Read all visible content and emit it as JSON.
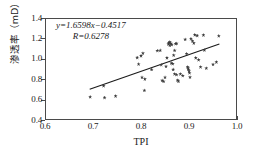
{
  "chart_data": {
    "type": "scatter",
    "title": "",
    "xlabel": "TPI",
    "ylabel": "渗透率（mD）",
    "xlim": [
      0.6,
      1.0
    ],
    "ylim": [
      0.4,
      1.4
    ],
    "xticks": [
      "0.6",
      "0.7",
      "0.8",
      "0.9",
      "1.0"
    ],
    "xtick_values": [
      0.6,
      0.7,
      0.8,
      0.9,
      1.0
    ],
    "yticks": [
      "0.4",
      "0.6",
      "0.8",
      "1.0",
      "1.2",
      "1.4"
    ],
    "ytick_values": [
      0.4,
      0.6,
      0.8,
      1.0,
      1.2,
      1.4
    ],
    "grid": false,
    "legend": null,
    "marker_color": "#3d3d3d",
    "line_color": "#1a1a1a",
    "annotations": {
      "equation": "y=1.6598x−0.4517",
      "equation_slope": 1.6598,
      "equation_intercept": -0.4517,
      "correlation_label": "R=0.6278",
      "correlation_value": 0.6278
    },
    "trendline": {
      "x": [
        0.692,
        0.965
      ],
      "y": [
        0.697,
        1.151
      ]
    },
    "points": [
      [
        0.692,
        0.637
      ],
      [
        0.72,
        0.745
      ],
      [
        0.722,
        0.63
      ],
      [
        0.745,
        0.645
      ],
      [
        0.79,
        1.022
      ],
      [
        0.793,
        0.958
      ],
      [
        0.798,
        1.04
      ],
      [
        0.802,
        1.065
      ],
      [
        0.8,
        0.828
      ],
      [
        0.806,
        0.812
      ],
      [
        0.805,
        0.7
      ],
      [
        0.82,
        0.905
      ],
      [
        0.832,
        1.09
      ],
      [
        0.838,
        1.093
      ],
      [
        0.84,
        0.952
      ],
      [
        0.842,
        0.798
      ],
      [
        0.845,
        0.788
      ],
      [
        0.848,
        0.828
      ],
      [
        0.85,
        0.935
      ],
      [
        0.852,
        1.02
      ],
      [
        0.855,
        1.155
      ],
      [
        0.856,
        1.168
      ],
      [
        0.858,
        1.175
      ],
      [
        0.86,
        1.16
      ],
      [
        0.862,
        1.15
      ],
      [
        0.858,
        1.142
      ],
      [
        0.861,
        0.968
      ],
      [
        0.864,
        0.962
      ],
      [
        0.866,
        1.045
      ],
      [
        0.868,
        1.092
      ],
      [
        0.87,
        1.158
      ],
      [
        0.872,
        1.16
      ],
      [
        0.865,
        0.905
      ],
      [
        0.868,
        0.862
      ],
      [
        0.872,
        0.855
      ],
      [
        0.874,
        0.8
      ],
      [
        0.876,
        0.79
      ],
      [
        0.88,
        0.862
      ],
      [
        0.885,
        0.845
      ],
      [
        0.89,
        1.2
      ],
      [
        0.893,
        1.06
      ],
      [
        0.895,
        0.93
      ],
      [
        0.896,
        0.918
      ],
      [
        0.897,
        0.905
      ],
      [
        0.898,
        0.888
      ],
      [
        0.899,
        0.872
      ],
      [
        0.9,
        0.83
      ],
      [
        0.902,
        1.208
      ],
      [
        0.905,
        1.185
      ],
      [
        0.908,
        1.165
      ],
      [
        0.91,
        1.245
      ],
      [
        0.915,
        1.238
      ],
      [
        0.912,
        1.02
      ],
      [
        0.918,
        1.0
      ],
      [
        0.922,
        0.93
      ],
      [
        0.928,
        1.243
      ],
      [
        0.93,
        1.095
      ],
      [
        0.934,
        0.918
      ],
      [
        0.948,
        0.955
      ],
      [
        0.955,
        0.978
      ],
      [
        0.96,
        1.235
      ]
    ]
  }
}
